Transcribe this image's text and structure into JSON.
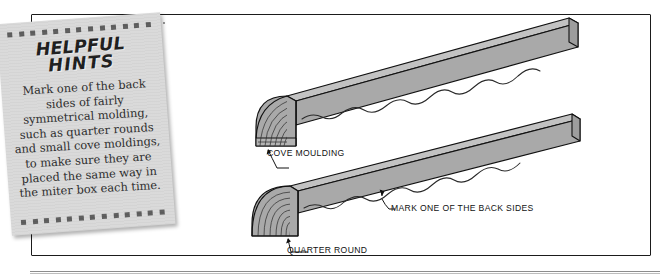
{
  "figure": {
    "kind": "woodworking-instruction-illustration",
    "note": {
      "title_line1": "HELPFUL",
      "title_line2": "HINTS",
      "body": "Mark one of the back sides of fairly symmetrical molding, such as quarter rounds and small cove moldings, to make sure they are placed the same way in the miter box each time.",
      "paper_color": "#d9d9d9",
      "dot_color": "#5d5d5d",
      "dot_count_top": 13,
      "dot_count_bottom": 13
    },
    "labels": {
      "cove": "COVE MOULDING",
      "quarter_round": "QUARTER ROUND",
      "mark_back_sides": "MARK ONE OF THE BACK SIDES"
    },
    "objects": [
      {
        "name": "cove-moulding-board",
        "profile": "cove",
        "fill": "#a9a9a9",
        "top_face_fill": "#bdbdbd",
        "outline": "#111111",
        "grain_mark": "wavy-line"
      },
      {
        "name": "quarter-round-board",
        "profile": "quarter-round",
        "fill": "#a9a9a9",
        "top_face_fill": "#bdbdbd",
        "outline": "#111111",
        "grain_mark": "wavy-line"
      }
    ],
    "frame": {
      "stroke": "#1b1b1b",
      "rule_color": "#8d8d8d"
    }
  }
}
